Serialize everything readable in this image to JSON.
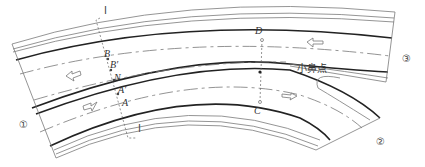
{
  "diagram": {
    "section_marks": [
      "Ⅰ",
      "Ⅰ"
    ],
    "points": {
      "B": "B",
      "B_prime": "B′",
      "N": "N",
      "A_prime": "A′",
      "A": "A",
      "D": "D",
      "C": "C"
    },
    "nose_label": "小鼻点",
    "branches": [
      "①",
      "②",
      "③"
    ]
  }
}
